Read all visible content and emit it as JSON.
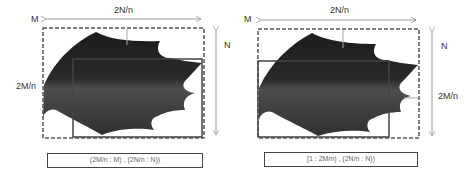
{
  "diagram": {
    "panels": [
      {
        "labels": {
          "corner": "M",
          "top_width": "2N/n",
          "right_height": "N",
          "side_height": "2M/n"
        },
        "caption": "(2M/n : M) , (2N/n : N))"
      },
      {
        "labels": {
          "corner": "M",
          "top_width": "2N/n",
          "right_height": "N",
          "side_height": "2M/n"
        },
        "caption": "[1 : 2M/n) , (2N/n : N))"
      }
    ],
    "colors": {
      "leaf_dark": "#1e1e1e",
      "leaf_mid": "#4a4a4a",
      "frame": "#555555",
      "arrow": "#9a9a9a"
    }
  }
}
